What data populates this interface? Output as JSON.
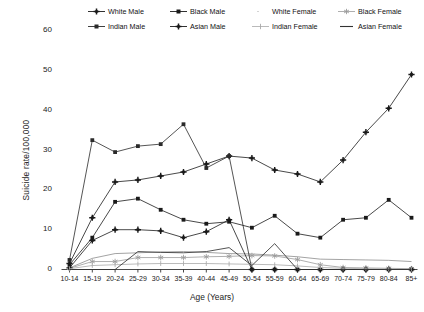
{
  "chart_data": {
    "type": "line",
    "title": "",
    "xlabel": "Age (Years)",
    "ylabel": "Suicide rate/100,000",
    "categories": [
      "10-14",
      "15-19",
      "20-24",
      "25-29",
      "30-34",
      "35-39",
      "40-44",
      "45-49",
      "50-54",
      "55-59",
      "60-64",
      "65-69",
      "70-74",
      "75-79",
      "80-84",
      "85+"
    ],
    "yticks": [
      0,
      10,
      20,
      30,
      40,
      50,
      60
    ],
    "ylim": [
      0,
      62
    ],
    "grid": false,
    "legend_position": "top",
    "series": [
      {
        "name": "White Male",
        "marker": "plus-filled",
        "color": "#1a1a1a",
        "values": [
          1.5,
          13.0,
          22.0,
          22.5,
          23.5,
          24.5,
          26.5,
          28.5,
          28.0,
          25.0,
          24.0,
          22.0,
          27.5,
          34.5,
          40.5,
          49.0
        ]
      },
      {
        "name": "Black Male",
        "marker": "square-filled",
        "color": "#1a1a1a",
        "values": [
          1.2,
          8.0,
          17.0,
          17.8,
          15.0,
          12.5,
          11.5,
          12.0,
          10.5,
          13.5,
          9.0,
          8.0,
          12.5,
          13.0,
          17.5,
          13.0
        ]
      },
      {
        "name": "White Female",
        "marker": "none",
        "color": "#8c8c8c",
        "values": [
          0.4,
          2.8,
          4.0,
          4.2,
          4.4,
          4.5,
          4.3,
          4.0,
          3.9,
          3.6,
          3.2,
          2.6,
          2.5,
          2.4,
          2.3,
          2.0
        ]
      },
      {
        "name": "Black Female",
        "marker": "star",
        "color": "#9a9a9a",
        "values": [
          0.3,
          2.0,
          2.0,
          3.0,
          3.0,
          3.0,
          3.2,
          3.3,
          3.5,
          3.4,
          2.5,
          1.2,
          0.5,
          0.4,
          0.3,
          0.2
        ]
      },
      {
        "name": "Indian Male",
        "marker": "square-filled",
        "color": "#2a2a2a",
        "values": [
          2.4,
          32.5,
          29.5,
          31.0,
          31.5,
          36.5,
          25.5,
          28.5,
          0.0,
          0.0,
          0.0,
          0.0,
          0.0,
          0.0,
          0.0,
          0.0
        ]
      },
      {
        "name": "Asian Male",
        "marker": "plus-filled",
        "color": "#1a1a1a",
        "values": [
          0.4,
          7.3,
          10.0,
          10.0,
          9.7,
          8.0,
          9.5,
          12.5,
          0.0,
          0.0,
          0.0,
          0.0,
          0.0,
          0.0,
          0.0,
          0.0
        ]
      },
      {
        "name": "Indian Female",
        "marker": "plus-thin",
        "color": "#a8a8a8",
        "values": [
          0.2,
          1.0,
          1.2,
          1.4,
          1.5,
          1.5,
          1.5,
          1.4,
          1.3,
          1.2,
          0.9,
          0.5,
          0.3,
          0.2,
          0.1,
          0.1
        ]
      },
      {
        "name": "Asian Female",
        "marker": "line",
        "color": "#333333",
        "values": [
          0.0,
          0.0,
          0.0,
          4.5,
          4.3,
          4.2,
          4.5,
          5.5,
          1.0,
          6.5,
          0.0,
          0.0,
          0.0,
          0.0,
          0.0,
          0.0
        ]
      }
    ]
  }
}
